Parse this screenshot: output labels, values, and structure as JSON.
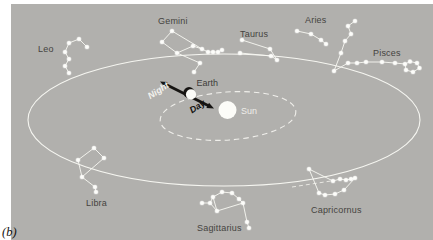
{
  "figure": {
    "panel_label": "(b)",
    "width": 433,
    "height": 240
  },
  "colors": {
    "background": "#b1b0ad",
    "margin": "#ffffff",
    "line_white": "#f8f8f3",
    "star_white": "#fdfdfa",
    "label_dark": "#454340",
    "label_light": "#efeeea",
    "black": "#161412",
    "sun_fill": "#fcfcf8"
  },
  "sun": {
    "label": "Sun",
    "cx": 227.5,
    "cy": 110,
    "r": 9,
    "label_x": 241,
    "label_y": 113.5
  },
  "earth": {
    "label": "Earth",
    "cx": 189.5,
    "cy": 93,
    "r": 5.5,
    "label_x": 196.5,
    "label_y": 86
  },
  "day_night_arrow": {
    "night_label": "Night",
    "day_label": "Day",
    "night_label_x": 160,
    "night_label_y": 93,
    "day_label_x": 199,
    "day_label_y": 109,
    "rotation_deg": -33,
    "x1": 164,
    "y1": 83.5,
    "x2": 210,
    "y2": 106.5,
    "night_head_points": "160,81.5 164.9,87.3 167.6,81.9",
    "day_head_points": "214,108.5 206.4,108.1 209,102.7"
  },
  "earth_orbit": {
    "cx": 228,
    "cy": 116,
    "rx": 68,
    "ry": 24,
    "style": "dashed"
  },
  "zodiac_band": {
    "cx": 224,
    "cy": 120,
    "rx": 196,
    "ry": 66
  },
  "ecliptic_dash": {
    "x1": 292,
    "y1": 187,
    "x2": 331,
    "y2": 181
  },
  "constellations": [
    {
      "name": "Leo",
      "label_x": 38,
      "label_y": 52,
      "stars": [
        [
          79,
          39
        ],
        [
          69,
          43
        ],
        [
          87,
          47
        ],
        [
          65,
          52
        ],
        [
          69,
          59
        ],
        [
          65,
          66
        ],
        [
          69,
          73
        ]
      ],
      "lines": [
        [
          0,
          1
        ],
        [
          0,
          2
        ],
        [
          1,
          3
        ],
        [
          3,
          4
        ],
        [
          4,
          5
        ],
        [
          5,
          6
        ]
      ]
    },
    {
      "name": "Gemini",
      "label_x": 158,
      "label_y": 24,
      "stars": [
        [
          172,
          31
        ],
        [
          162,
          42
        ],
        [
          177,
          53
        ],
        [
          193,
          46
        ],
        [
          202,
          49
        ],
        [
          208,
          52
        ],
        [
          213,
          52
        ],
        [
          218,
          52
        ],
        [
          222,
          50
        ],
        [
          200,
          63
        ],
        [
          194,
          72
        ]
      ],
      "lines": [
        [
          0,
          1
        ],
        [
          1,
          2
        ],
        [
          0,
          4
        ],
        [
          2,
          3
        ],
        [
          3,
          4
        ],
        [
          4,
          5
        ],
        [
          5,
          6
        ],
        [
          6,
          7
        ],
        [
          7,
          8
        ],
        [
          2,
          9
        ],
        [
          9,
          10
        ]
      ]
    },
    {
      "name": "Taurus",
      "label_x": 240,
      "label_y": 37,
      "stars": [
        [
          242,
          40
        ],
        [
          270,
          49
        ],
        [
          277,
          60
        ],
        [
          240,
          53
        ],
        [
          271,
          56
        ]
      ],
      "lines": [
        [
          0,
          1
        ],
        [
          1,
          2
        ],
        [
          3,
          4
        ],
        [
          4,
          2
        ]
      ]
    },
    {
      "name": "Aries",
      "label_x": 305,
      "label_y": 23,
      "stars": [
        [
          297,
          31
        ],
        [
          311,
          34
        ],
        [
          321,
          40
        ],
        [
          326,
          44
        ]
      ],
      "lines": [
        [
          0,
          1
        ],
        [
          1,
          2
        ],
        [
          2,
          3
        ]
      ]
    },
    {
      "name": "Pisces",
      "label_x": 373,
      "label_y": 56,
      "stars": [
        [
          334,
          71
        ],
        [
          341,
          53
        ],
        [
          345,
          41
        ],
        [
          351,
          34
        ],
        [
          348,
          26
        ],
        [
          355,
          21
        ],
        [
          348,
          63
        ],
        [
          357,
          63
        ],
        [
          366,
          62
        ],
        [
          382,
          62
        ],
        [
          395,
          63
        ],
        [
          405,
          64
        ],
        [
          410,
          61.5
        ],
        [
          417,
          63
        ],
        [
          419.5,
          68
        ],
        [
          413,
          72
        ],
        [
          406,
          70
        ]
      ],
      "lines": [
        [
          0,
          1
        ],
        [
          1,
          2
        ],
        [
          2,
          3
        ],
        [
          3,
          4
        ],
        [
          4,
          5
        ],
        [
          0,
          6
        ],
        [
          6,
          7
        ],
        [
          7,
          8
        ],
        [
          8,
          9
        ],
        [
          9,
          10
        ],
        [
          10,
          11
        ],
        [
          11,
          12
        ],
        [
          12,
          13
        ],
        [
          13,
          14
        ],
        [
          14,
          15
        ],
        [
          15,
          16
        ],
        [
          16,
          11
        ]
      ]
    },
    {
      "name": "Libra",
      "label_x": 86,
      "label_y": 206,
      "stars": [
        [
          94,
          148
        ],
        [
          104,
          158
        ],
        [
          82,
          177
        ],
        [
          78,
          160
        ],
        [
          95,
          187
        ],
        [
          96,
          192
        ]
      ],
      "lines": [
        [
          0,
          1
        ],
        [
          1,
          2
        ],
        [
          2,
          3
        ],
        [
          3,
          0
        ],
        [
          2,
          4
        ],
        [
          4,
          5
        ]
      ]
    },
    {
      "name": "Sagittarius",
      "label_x": 197,
      "label_y": 231,
      "stars": [
        [
          222,
          192
        ],
        [
          232,
          193
        ],
        [
          213,
          197
        ],
        [
          239,
          199
        ],
        [
          243,
          203
        ],
        [
          210,
          203
        ],
        [
          202,
          203
        ],
        [
          217,
          211
        ],
        [
          247,
          222
        ],
        [
          249,
          228
        ]
      ],
      "lines": [
        [
          6,
          5
        ],
        [
          5,
          2
        ],
        [
          2,
          0
        ],
        [
          0,
          1
        ],
        [
          1,
          3
        ],
        [
          3,
          4
        ],
        [
          2,
          7
        ],
        [
          7,
          4
        ],
        [
          4,
          8
        ],
        [
          8,
          9
        ],
        [
          5,
          7
        ]
      ]
    },
    {
      "name": "Capricornus",
      "label_x": 311,
      "label_y": 213,
      "stars": [
        [
          309,
          169
        ],
        [
          333,
          181
        ],
        [
          340,
          179
        ],
        [
          346,
          180
        ],
        [
          351,
          179
        ],
        [
          355,
          178
        ],
        [
          319,
          193
        ],
        [
          325,
          195
        ],
        [
          335,
          194
        ],
        [
          344,
          190
        ]
      ],
      "lines": [
        [
          0,
          1
        ],
        [
          1,
          2
        ],
        [
          2,
          3
        ],
        [
          3,
          4
        ],
        [
          4,
          5
        ],
        [
          0,
          6
        ],
        [
          6,
          7
        ],
        [
          7,
          8
        ],
        [
          8,
          9
        ],
        [
          9,
          5
        ]
      ]
    }
  ]
}
